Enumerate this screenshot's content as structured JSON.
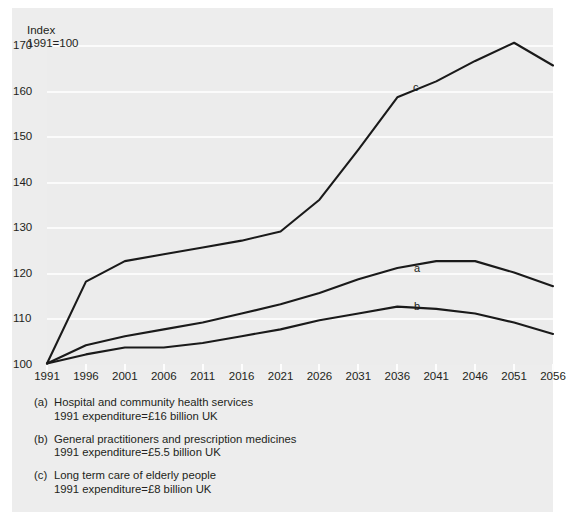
{
  "chart_data": {
    "type": "line",
    "title": "",
    "xlabel": "",
    "ylabel": "Index 1991=100",
    "ylabel_line1": "Index",
    "ylabel_line2": "1991=100",
    "grid": true,
    "legend_position": "below-plot",
    "xlim": [
      1991,
      2056
    ],
    "ylim": [
      100,
      170
    ],
    "yticks": [
      100,
      110,
      120,
      130,
      140,
      150,
      160,
      170
    ],
    "ytick_labels": [
      "100",
      "110",
      "120",
      "130",
      "140",
      "150",
      "160",
      "170"
    ],
    "categories": [
      1991,
      1996,
      2001,
      2006,
      2011,
      2016,
      2021,
      2026,
      2031,
      2036,
      2041,
      2046,
      2051,
      2056
    ],
    "xtick_labels": [
      "1991",
      "1996",
      "2001",
      "2006",
      "2011",
      "2016",
      "2021",
      "2026",
      "2031",
      "2036",
      "2041",
      "2046",
      "2051",
      "2056"
    ],
    "series": [
      {
        "key": "a",
        "name": "Hospital and community health services",
        "inline_label": "a",
        "values": [
          100,
          104,
          106,
          107.5,
          109,
          111,
          113,
          115.5,
          118.5,
          121,
          122.5,
          122.5,
          120,
          117
        ]
      },
      {
        "key": "b",
        "name": "General practitioners and prescription medicines",
        "inline_label": "b",
        "values": [
          100,
          102,
          103.5,
          103.5,
          104.5,
          106,
          107.5,
          109.5,
          111,
          112.5,
          112,
          111,
          109,
          106.5
        ]
      },
      {
        "key": "c",
        "name": "Long term care of elderly people",
        "inline_label": "c",
        "values": [
          100,
          118,
          122.5,
          124,
          125.5,
          127,
          129,
          136,
          147,
          158.5,
          162,
          166.5,
          170.5,
          165.5
        ]
      }
    ],
    "colors": {
      "line": "#1a1a1a",
      "plot_background": "#ececec",
      "page_background": "#ededed",
      "gridline": "#fbfbfb",
      "text": "#231f20"
    }
  },
  "legend": {
    "entries": [
      {
        "key": "(a)",
        "title": "Hospital and community health services",
        "detail": "1991 expenditure=£16 billion UK"
      },
      {
        "key": "(b)",
        "title": "General practitioners and prescription medicines",
        "detail": "1991 expenditure=£5.5 billion UK"
      },
      {
        "key": "(c)",
        "title": "Long term care of elderly people",
        "detail": "1991 expenditure=£8 billion UK"
      }
    ]
  }
}
